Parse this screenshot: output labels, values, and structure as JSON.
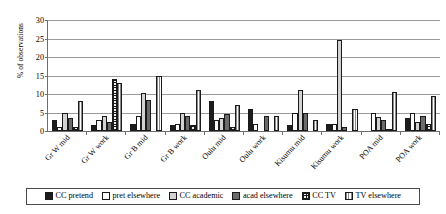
{
  "chart_data": {
    "type": "bar",
    "title": "",
    "xlabel": "",
    "ylabel": "% of observations",
    "ylim": [
      0,
      30
    ],
    "yticks": [
      0,
      5,
      10,
      15,
      20,
      25,
      30
    ],
    "grid": true,
    "legend_position": "bottom",
    "categories": [
      "Gr W mid",
      "Gr W work",
      "Gr B mid",
      "Gr B work",
      "Oulu mid",
      "Oulu work",
      "Kisumu mid",
      "Kisumu work",
      "POA mid",
      "POA work"
    ],
    "series": [
      {
        "name": "CC pretend",
        "color": "#1c1c1c",
        "values": [
          3.0,
          1.5,
          1.8,
          1.5,
          8.0,
          6.0,
          1.5,
          2.0,
          0.0,
          3.5
        ]
      },
      {
        "name": "pret elsewhere",
        "color": "#ffffff",
        "values": [
          1.0,
          3.0,
          4.0,
          2.0,
          3.0,
          2.0,
          5.0,
          2.0,
          5.0,
          5.0
        ]
      },
      {
        "name": "CC academic",
        "color": "#d2d2d2",
        "values": [
          5.0,
          4.0,
          10.3,
          5.0,
          3.5,
          0.0,
          11.0,
          24.5,
          3.8,
          2.5
        ]
      },
      {
        "name": "acad elsewhere",
        "color": "#6b6b6b",
        "values": [
          3.5,
          2.5,
          8.3,
          4.0,
          4.5,
          4.0,
          5.0,
          1.0,
          3.0,
          4.0
        ]
      },
      {
        "name": "CC TV",
        "color": "#efefef",
        "values": [
          1.2,
          14.0,
          0.0,
          1.5,
          1.0,
          0.0,
          0.0,
          0.0,
          0.5,
          2.0
        ]
      },
      {
        "name": "TV elsewhere",
        "color": "#f2f2f2",
        "values": [
          8.0,
          13.0,
          15.0,
          11.0,
          7.0,
          4.0,
          3.0,
          6.0,
          10.5,
          9.5
        ]
      }
    ]
  },
  "legend": {
    "items": [
      {
        "label": "CC pretend"
      },
      {
        "label": "pret elsewhere"
      },
      {
        "label": "CC academic"
      },
      {
        "label": "acad elsewhere"
      },
      {
        "label": "CC TV"
      },
      {
        "label": "TV elsewhere"
      }
    ]
  }
}
